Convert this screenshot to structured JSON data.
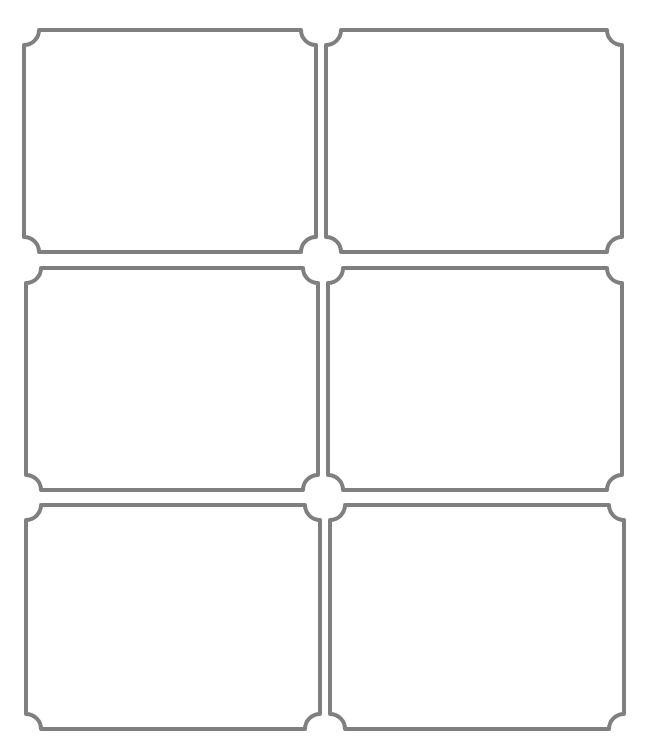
{
  "page": {
    "header_text": "",
    "stroke_color": "#7f7f7f",
    "background": "#ffffff"
  },
  "labels": [
    {
      "id": "label-1",
      "row": 1,
      "col": 1,
      "x": 24,
      "y": 30,
      "w": 292,
      "h": 222,
      "text": ""
    },
    {
      "id": "label-2",
      "row": 1,
      "col": 2,
      "x": 326,
      "y": 30,
      "w": 296,
      "h": 222,
      "text": ""
    },
    {
      "id": "label-3",
      "row": 2,
      "col": 1,
      "x": 26,
      "y": 268,
      "w": 292,
      "h": 222,
      "text": ""
    },
    {
      "id": "label-4",
      "row": 2,
      "col": 2,
      "x": 328,
      "y": 268,
      "w": 294,
      "h": 222,
      "text": ""
    },
    {
      "id": "label-5",
      "row": 3,
      "col": 1,
      "x": 26,
      "y": 505,
      "w": 294,
      "h": 224,
      "text": ""
    },
    {
      "id": "label-6",
      "row": 3,
      "col": 2,
      "x": 330,
      "y": 505,
      "w": 294,
      "h": 224,
      "text": ""
    }
  ],
  "corner_radius": 15
}
